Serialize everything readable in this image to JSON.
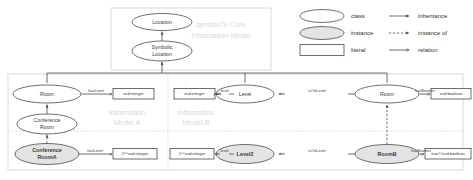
{
  "panels": {
    "core": {
      "title": "symbIoTe Core\nInformation Model",
      "line1": "symbIoTe Core",
      "line2": "Information Model"
    },
    "model_a": {
      "line1": "Information",
      "line2": "Model A"
    },
    "model_b": {
      "line1": "Information",
      "line2": "Model B"
    }
  },
  "legend": {
    "shapes": [
      {
        "icon": "ellipse-outline-icon",
        "label": "class"
      },
      {
        "icon": "ellipse-filled-icon",
        "label": "instance"
      },
      {
        "icon": "rectangle-outline-icon",
        "label": "literal"
      }
    ],
    "arrows": [
      {
        "icon": "solid-arrow-filled-head-icon",
        "label": "inheritance"
      },
      {
        "icon": "dashed-arrow-filled-head-icon",
        "label": "instance of"
      },
      {
        "icon": "solid-arrow-open-head-icon",
        "label": "relation"
      }
    ]
  },
  "nodes": {
    "location": {
      "label": "Location",
      "kind": "class"
    },
    "symbolic_location": {
      "line1": "Symbolic",
      "line2": "Location",
      "kind": "class"
    },
    "room_a": {
      "label": "Room",
      "kind": "class"
    },
    "conference_room": {
      "line1": "Conference",
      "line2": "Room",
      "kind": "class"
    },
    "conference_room_a": {
      "line1": "Conference",
      "line2": "RoomA",
      "kind": "instance"
    },
    "level": {
      "label": "Level",
      "kind": "class"
    },
    "level2": {
      "label": "Level2",
      "kind": "instance"
    },
    "room_b": {
      "label": "Room",
      "kind": "class"
    },
    "roomb_inst": {
      "label": "RoomB",
      "kind": "instance"
    }
  },
  "literals": {
    "xsd_integer_a": "xsd:integer",
    "xsd_integer_b": "xsd:integer",
    "xsd_boolean": "xsd:boolean",
    "one_xsd_integer_a": "1^^xsd:integer",
    "one_xsd_integer_b": "1^^xsd:integer",
    "true_xsd_boolean": "true^^xsd:boolean"
  },
  "edges": {
    "has_level_a": "hasLevel",
    "has_level_a_inst": "hasLevel",
    "level_b": "level",
    "level_b_inst": "level",
    "is_on_level": "isOnLevel",
    "is_on_level_inst": "isOnLevel",
    "has_beamer": "hasBeamer",
    "has_beamer_inst": "hasBeamer"
  },
  "colors": {
    "stroke": "#4a4a4a",
    "instance_fill": "#e4e4e4",
    "panel_stroke": "#d0d0d0",
    "watermark": "#d8d8d8",
    "text": "#3a3a3a"
  }
}
